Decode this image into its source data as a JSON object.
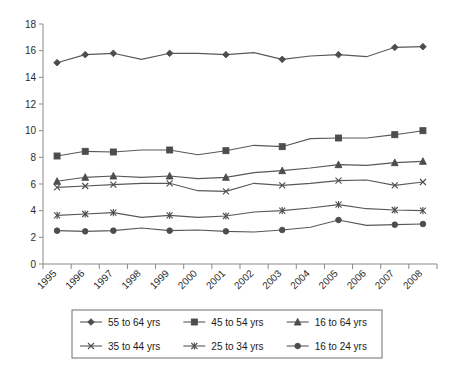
{
  "chart_data": {
    "type": "line",
    "title": "",
    "subtitle": "",
    "xlabel": "",
    "ylabel": "",
    "grid": false,
    "legend_position": "bottom",
    "ylim": [
      0,
      18
    ],
    "ytick_step": 2,
    "yticks": [
      "0",
      "2",
      "4",
      "6",
      "8",
      "10",
      "12",
      "14",
      "16",
      "18"
    ],
    "categories": [
      "1995",
      "1996",
      "1997",
      "1998",
      "1999",
      "2000",
      "2001",
      "2002",
      "2003",
      "2004",
      "2005",
      "2006",
      "2007",
      "2008"
    ],
    "series": [
      {
        "name": "55 to 64 yrs",
        "marker": "diamond",
        "color": "#4d4d4d",
        "values": [
          15.1,
          15.7,
          15.8,
          15.35,
          15.8,
          15.8,
          15.7,
          15.85,
          15.35,
          15.6,
          15.7,
          15.55,
          16.25,
          16.3
        ]
      },
      {
        "name": "45 to 54 yrs",
        "marker": "square",
        "color": "#333333",
        "values": [
          8.1,
          8.45,
          8.4,
          8.55,
          8.55,
          8.2,
          8.5,
          8.9,
          8.8,
          9.4,
          9.45,
          9.45,
          9.7,
          10.0
        ]
      },
      {
        "name": "16 to 64 yrs",
        "marker": "triangle",
        "color": "#4d4d4d",
        "values": [
          6.2,
          6.5,
          6.6,
          6.5,
          6.6,
          6.4,
          6.5,
          6.85,
          7.0,
          7.2,
          7.45,
          7.4,
          7.6,
          7.7
        ]
      },
      {
        "name": "35 to 44 yrs",
        "marker": "x",
        "color": "#4d4d4d",
        "values": [
          5.75,
          5.85,
          5.95,
          6.05,
          6.05,
          5.5,
          5.45,
          6.05,
          5.9,
          6.05,
          6.25,
          6.3,
          5.9,
          6.15
        ]
      },
      {
        "name": "25 to 34 yrs",
        "marker": "asterisk",
        "color": "#4d4d4d",
        "values": [
          3.65,
          3.75,
          3.85,
          3.5,
          3.65,
          3.5,
          3.6,
          3.9,
          4.0,
          4.2,
          4.45,
          4.15,
          4.05,
          4.0
        ]
      },
      {
        "name": "16 to 24 yrs",
        "marker": "circle",
        "color": "#4d4d4d",
        "values": [
          2.5,
          2.45,
          2.5,
          2.7,
          2.5,
          2.55,
          2.45,
          2.4,
          2.55,
          2.75,
          3.3,
          2.9,
          2.95,
          3.0
        ]
      }
    ]
  },
  "legend": {
    "entries": [
      {
        "label": "55 to 64 yrs",
        "marker": "diamond"
      },
      {
        "label": "45 to 54 yrs",
        "marker": "square"
      },
      {
        "label": "16 to 64 yrs",
        "marker": "triangle"
      },
      {
        "label": "35 to 44 yrs",
        "marker": "x"
      },
      {
        "label": "25 to 34 yrs",
        "marker": "asterisk"
      },
      {
        "label": "16 to 24 yrs",
        "marker": "circle"
      }
    ]
  },
  "colors": {
    "background": "#ffffff",
    "axis": "#8a8a8a",
    "line": "#585858",
    "marker": "#4d4d4d",
    "text": "#1a1a1a",
    "legend_border": "#6e6e6e"
  }
}
